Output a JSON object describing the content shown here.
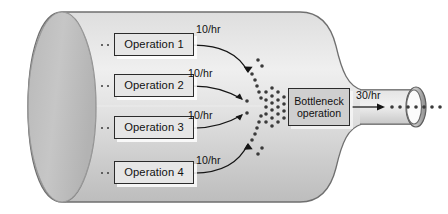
{
  "diagram": {
    "funnel": {
      "body_label": "funnel-body",
      "neck_label": "funnel-neck",
      "opening_label": "funnel-opening-ring"
    },
    "operations": [
      {
        "label": "Operation 1",
        "rate": "10/hr"
      },
      {
        "label": "Operation 2",
        "rate": "10/hr"
      },
      {
        "label": "Operation 3",
        "rate": "10/hr"
      },
      {
        "label": "Operation 4",
        "rate": "10/hr"
      }
    ],
    "bottleneck": {
      "line1": "Bottleneck",
      "line2": "operation",
      "output_rate": "30/hr"
    },
    "colors": {
      "funnel_light": "#e3e3e3",
      "funnel_mid": "#c9c9c9",
      "funnel_dark": "#b4b4b4",
      "outline": "#6f6f6f",
      "box_fill": "#e6e6e6",
      "bottleneck_fill": "#cfcfcf",
      "text": "#111111",
      "dot": "#3a3a3a"
    }
  }
}
